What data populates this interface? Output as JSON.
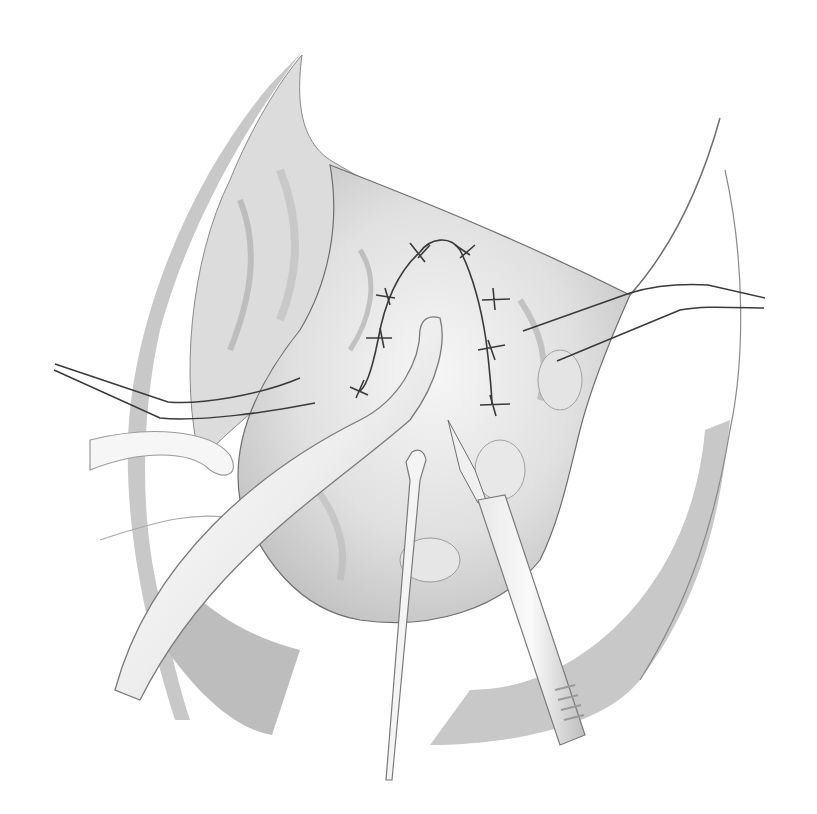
{
  "illustration": {
    "style": "grayscale surgical line illustration",
    "colors": {
      "background": "#ffffff",
      "drape_gray": "#c8c8c8",
      "drape_dark": "#b4b4b4",
      "tissue_light": "#ededed",
      "tissue_mid": "#d9d9d9",
      "tissue_shadow": "#9a9a9a",
      "outline": "#6e6e6e",
      "suture": "#3a3a3a",
      "instrument_fill": "#f4f4f4",
      "instrument_edge": "#8a8a8a"
    },
    "elements": [
      "surgical-drape-left",
      "surgical-drape-right",
      "operative-field-tissue",
      "sutured-anastomosis",
      "drain-tube",
      "retractor-left",
      "retractor-right",
      "probe-instrument",
      "scalpel-instrument",
      "retracted-vessel-left"
    ]
  }
}
